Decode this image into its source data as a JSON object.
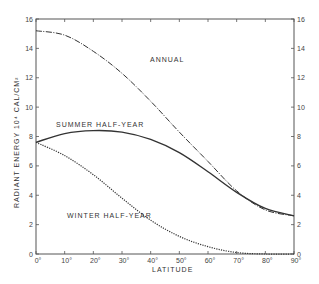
{
  "chart_data": {
    "type": "line",
    "title": "",
    "xlabel": "LATITUDE",
    "ylabel": "RADIANT ENERGY 10⁴ CAL/CM²",
    "xlim": [
      0,
      90
    ],
    "ylim": [
      0,
      16
    ],
    "grid": false,
    "legend": "inline labels",
    "x": [
      0,
      10,
      20,
      30,
      40,
      50,
      60,
      70,
      80,
      90
    ],
    "x_tick_labels": [
      "0°",
      "10°",
      "20°",
      "30°",
      "40°",
      "50°",
      "60°",
      "70°",
      "80°",
      "90°"
    ],
    "y_ticks": [
      0,
      2,
      4,
      6,
      8,
      10,
      12,
      14,
      16
    ],
    "series": [
      {
        "name": "ANNUAL",
        "style": "dash-dot",
        "values": [
          15.2,
          14.9,
          13.8,
          12.3,
          10.4,
          8.3,
          6.3,
          4.3,
          3.0,
          2.6
        ]
      },
      {
        "name": "SUMMER HALF-YEAR",
        "style": "solid",
        "values": [
          7.6,
          8.2,
          8.4,
          8.3,
          7.8,
          6.9,
          5.6,
          4.2,
          3.1,
          2.6
        ]
      },
      {
        "name": "WINTER HALF-YEAR",
        "style": "dotted",
        "values": [
          7.6,
          6.7,
          5.4,
          3.8,
          2.3,
          1.2,
          0.5,
          0.1,
          0.0,
          0.0
        ]
      }
    ],
    "annotations": [
      {
        "text": "ANNUAL",
        "x": 40,
        "y": 13.5
      },
      {
        "text": "SUMMER HALF-YEAR",
        "x": 9,
        "y": 9.0
      },
      {
        "text": "WINTER HALF-YEAR",
        "x": 10,
        "y": 2.7
      }
    ]
  },
  "labels": {
    "annual": "ANNUAL",
    "summer": "SUMMER HALF-YEAR",
    "winter": "WINTER HALF-YEAR",
    "xlabel": "LATITUDE",
    "ylabel": "RADIANT ENERGY  10⁴ CAL/CM²"
  }
}
